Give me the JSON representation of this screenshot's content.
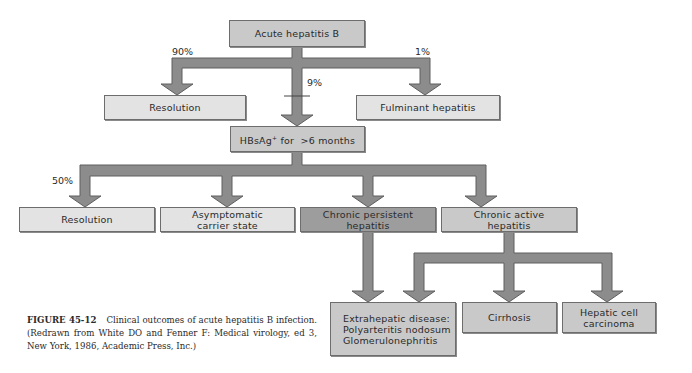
{
  "colors": {
    "arrow_fill": "#8c8c8c",
    "arrow_stroke": "#5e5e5e",
    "box_light": "#e3e3e3",
    "box_mid": "#c9c9c9",
    "box_dark": "#9d9d9d"
  },
  "nodes": {
    "acute": "Acute hepatitis B",
    "resolution_1": "Resolution",
    "fulminant": "Fulminant hepatitis",
    "hbsag_prefix": "HBsAg",
    "hbsag_sup": "+",
    "hbsag_suffix": " for  >6 months",
    "resolution_2": "Resolution",
    "asymptomatic": "Asymptomatic\ncarrier state",
    "chronic_persistent": "Chronic persistent\nhepatitis",
    "chronic_active": "Chronic active\nhepatitis",
    "extrahepatic": "Extrahepatic disease:\nPolyarteritis nodosum\nGlomerulonephritis",
    "cirrhosis": "Cirrhosis",
    "hcc": "Hepatic cell\ncarcinoma"
  },
  "percentages": {
    "resolution": "90%",
    "fulminant": "1%",
    "chronic": "9%",
    "resolution_2": "50%"
  },
  "caption": {
    "label": "FIGURE 45-12",
    "text": "Clinical outcomes of acute hepatitis B infection. (Redrawn from White DO and Fenner F: Medical virology, ed 3, New York, 1986, Academic Press, Inc.)"
  }
}
